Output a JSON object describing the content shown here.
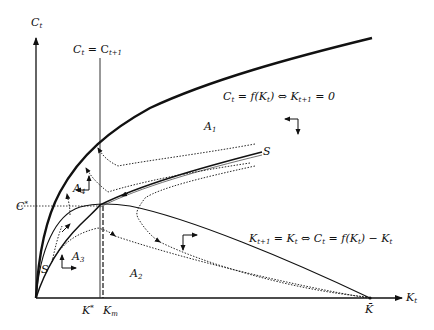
{
  "figure": {
    "type": "phase-diagram",
    "axes": {
      "y_label": {
        "base": "C",
        "sub": "t"
      },
      "x_label": {
        "base": "K",
        "sub": "t"
      }
    },
    "curves": {
      "production": {
        "label_left": "C",
        "label_left_sub": "t",
        "label_rest": " = f(K",
        "label_rest_sub": "t",
        "label_tail": ") ⇔ K",
        "label_tail_sub": "t+1",
        "label_end": " = 0"
      },
      "capital_locus": {
        "p1": "K",
        "p1_sub": "t+1",
        "p2": " = K",
        "p2_sub": "t",
        "p3": " ⇔ C",
        "p3_sub": "t",
        "p4": " = f(K",
        "p4_sub": "t",
        "p5": ") − K",
        "p5_sub": "t"
      },
      "consumption_locus": {
        "p1": "C",
        "p1_sub": "t",
        "p2": " = C",
        "p2_sub": "t+1"
      },
      "saddle_path": {
        "label": "S"
      }
    },
    "regions": [
      {
        "base": "A",
        "sub": "1"
      },
      {
        "base": "A",
        "sub": "2"
      },
      {
        "base": "A",
        "sub": "3"
      },
      {
        "base": "A",
        "sub": "4"
      }
    ],
    "ticks": {
      "c_star": {
        "base": "C",
        "sup": "*"
      },
      "k_star": {
        "base": "K",
        "sup": "*"
      },
      "k_m": {
        "base": "K",
        "sub": "m"
      },
      "k_bar": {
        "base": "K̄"
      }
    },
    "saddle_start_label": "S"
  }
}
